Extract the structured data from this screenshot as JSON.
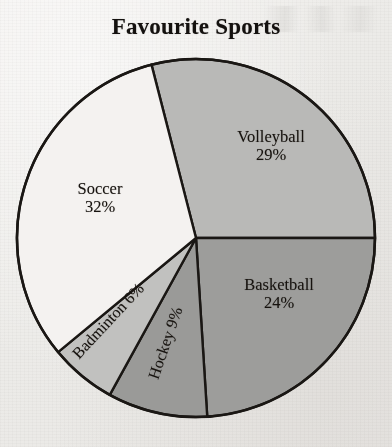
{
  "chart_data": {
    "type": "pie",
    "title": "Favourite Sports",
    "xlabel": "",
    "ylabel": "",
    "legend_position": "none",
    "grid": false,
    "units": "percent",
    "total": 100,
    "categories": [
      "Volleyball",
      "Basketball",
      "Hockey",
      "Badminton",
      "Soccer"
    ],
    "values": [
      29,
      24,
      9,
      6,
      32
    ],
    "slices": [
      {
        "label": "Volleyball",
        "percent": 29,
        "value_text": "29%",
        "color": "#b9b9b7",
        "label_text": "Volleyball",
        "start_angle_deg": -104.4,
        "end_angle_deg": 0.0,
        "label_rotation_deg": 0
      },
      {
        "label": "Basketball",
        "percent": 24,
        "value_text": "24%",
        "color": "#9d9d9b",
        "label_text": "Basketball",
        "start_angle_deg": 0.0,
        "end_angle_deg": 86.4,
        "label_rotation_deg": 0
      },
      {
        "label": "Hockey",
        "percent": 9,
        "value_text": "9%",
        "color": "#9a9a98",
        "label_text": "Hockey",
        "start_angle_deg": 86.4,
        "end_angle_deg": 118.8,
        "label_rotation_deg": -71
      },
      {
        "label": "Badminton",
        "percent": 6,
        "value_text": "6%",
        "color": "#c1c1bf",
        "label_text": "Badminton",
        "start_angle_deg": 118.8,
        "end_angle_deg": 140.4,
        "label_rotation_deg": -47
      },
      {
        "label": "Soccer",
        "percent": 32,
        "value_text": "32%",
        "color": "#f4f2f0",
        "label_text": "Soccer",
        "start_angle_deg": 140.4,
        "end_angle_deg": 255.6,
        "label_rotation_deg": 0
      }
    ],
    "geometry": {
      "center_x": 196,
      "center_y": 238,
      "radius": 179
    },
    "stroke_color": "#1a1714",
    "background_color": "#efedeb"
  },
  "labels": {
    "volleyball": {
      "name": "Volleyball",
      "pct": "29%"
    },
    "basketball": {
      "name": "Basketball",
      "pct": "24%"
    },
    "soccer": {
      "name": "Soccer",
      "pct": "32%"
    },
    "badminton": {
      "text": "Badminton 6%"
    },
    "hockey": {
      "text": "Hockey 9%"
    }
  }
}
